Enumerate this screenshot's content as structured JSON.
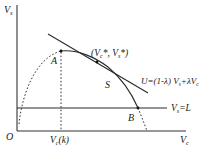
{
  "diagram": {
    "axes": {
      "y_label_main": "V",
      "y_label_sub": "s",
      "x_label_main": "V",
      "x_label_sub": "c",
      "origin_label": "O"
    },
    "points": {
      "A": "A",
      "B": "B",
      "S": "S"
    },
    "tangent_point_label": {
      "open": "(V",
      "sub1": "c",
      "star1": "*, V",
      "sub2": "s",
      "close": "*)"
    },
    "utility_line_label": {
      "prefix": "U=(1-λ) V",
      "sub1": "s",
      "mid": "+λV",
      "sub2": "c"
    },
    "threshold_line_label": {
      "main": "V",
      "sub": "s",
      "suffix": "=L"
    },
    "x_tick_label": {
      "main": "V",
      "sub": "c",
      "suffix": "(k)"
    },
    "colors": {
      "line": "#2a2a2a",
      "text": "#1a1a1a",
      "background": "#ffffff"
    }
  }
}
